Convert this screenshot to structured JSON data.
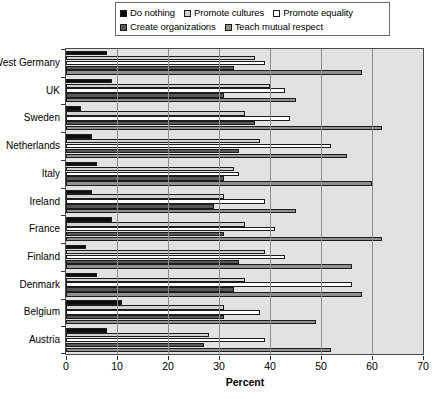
{
  "chart_data": {
    "type": "bar",
    "orientation": "horizontal",
    "title": "",
    "xlabel": "Percent",
    "ylabel": "",
    "xlim": [
      0,
      70
    ],
    "xticks": [
      0,
      10,
      20,
      30,
      40,
      50,
      60,
      70
    ],
    "grid": true,
    "legend_position": "top",
    "categories": [
      "West Germany",
      "UK",
      "Sweden",
      "Netherlands",
      "Italy",
      "Ireland",
      "France",
      "Finland",
      "Denmark",
      "Belgium",
      "Austria"
    ],
    "series": [
      {
        "name": "Do nothing",
        "color": "#0d0d0d",
        "values": [
          8,
          9,
          3,
          5,
          6,
          5,
          9,
          4,
          6,
          11,
          8
        ]
      },
      {
        "name": "Promote cultures",
        "color": "#d2d2d2",
        "values": [
          37,
          40,
          35,
          38,
          33,
          31,
          35,
          39,
          35,
          31,
          28
        ]
      },
      {
        "name": "Promote equality",
        "color": "#ffffff",
        "values": [
          39,
          43,
          44,
          52,
          34,
          39,
          41,
          43,
          56,
          38,
          39
        ]
      },
      {
        "name": "Create organizations",
        "color": "#585858",
        "values": [
          33,
          31,
          37,
          34,
          31,
          29,
          31,
          34,
          33,
          31,
          27
        ]
      },
      {
        "name": "Teach mutual respect",
        "color": "#909090",
        "values": [
          58,
          45,
          62,
          55,
          60,
          45,
          62,
          56,
          58,
          49,
          52
        ]
      }
    ]
  },
  "legend": {
    "rows": [
      [
        {
          "label": "Do nothing",
          "swatch": "#0d0d0d"
        },
        {
          "label": "Promote cultures",
          "swatch": "#d2d2d2"
        },
        {
          "label": "Promote equality",
          "swatch": "#ffffff"
        }
      ],
      [
        {
          "label": "Create organizations",
          "swatch": "#585858"
        },
        {
          "label": "Teach mutual respect",
          "swatch": "#909090"
        }
      ]
    ]
  }
}
